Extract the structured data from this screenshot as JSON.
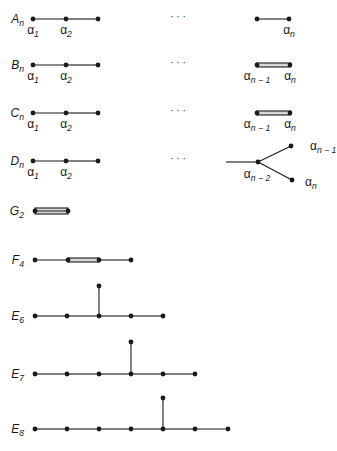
{
  "figure": {
    "ink_color": "#1a1a1a",
    "bond_fill": "#d8d8d8",
    "ellipsis": "· · ·",
    "diagrams": [
      {
        "id": "A_n",
        "label": "A",
        "sub": "n",
        "label_pos": [
          24,
          19
        ],
        "nodes": [
          [
            33,
            19
          ],
          [
            66,
            19
          ],
          [
            98,
            19
          ],
          [
            257,
            19
          ],
          [
            289,
            19
          ]
        ],
        "bonds": [
          {
            "from": 0,
            "to": 1,
            "type": "single"
          },
          {
            "from": 1,
            "to": 2,
            "type": "single"
          },
          {
            "from": 3,
            "to": 4,
            "type": "single"
          }
        ],
        "ellipsis_pos": [
          178,
          20
        ],
        "node_labels": [
          {
            "text": "α",
            "sub": "1",
            "x": 33,
            "y": 34
          },
          {
            "text": "α",
            "sub": "2",
            "x": 66,
            "y": 34
          },
          {
            "text": "α",
            "sub": "n",
            "x": 289,
            "y": 34
          }
        ]
      },
      {
        "id": "B_n",
        "label": "B",
        "sub": "n",
        "label_pos": [
          24,
          65
        ],
        "nodes": [
          [
            33,
            65
          ],
          [
            66,
            65
          ],
          [
            98,
            65
          ],
          [
            257,
            65
          ],
          [
            290,
            65
          ]
        ],
        "bonds": [
          {
            "from": 0,
            "to": 1,
            "type": "single"
          },
          {
            "from": 1,
            "to": 2,
            "type": "single"
          },
          {
            "from": 3,
            "to": 4,
            "type": "double"
          }
        ],
        "ellipsis_pos": [
          178,
          66
        ],
        "node_labels": [
          {
            "text": "α",
            "sub": "1",
            "x": 33,
            "y": 80
          },
          {
            "text": "α",
            "sub": "2",
            "x": 66,
            "y": 80
          },
          {
            "text": "α",
            "sub": "n − 1",
            "x": 257,
            "y": 80
          },
          {
            "text": "α",
            "sub": "n",
            "x": 290,
            "y": 80
          }
        ]
      },
      {
        "id": "C_n",
        "label": "C",
        "sub": "n",
        "label_pos": [
          24,
          113
        ],
        "nodes": [
          [
            33,
            113
          ],
          [
            66,
            113
          ],
          [
            98,
            113
          ],
          [
            257,
            113
          ],
          [
            290,
            113
          ]
        ],
        "bonds": [
          {
            "from": 0,
            "to": 1,
            "type": "single"
          },
          {
            "from": 1,
            "to": 2,
            "type": "single"
          },
          {
            "from": 3,
            "to": 4,
            "type": "double"
          }
        ],
        "ellipsis_pos": [
          178,
          114
        ],
        "node_labels": [
          {
            "text": "α",
            "sub": "1",
            "x": 33,
            "y": 128
          },
          {
            "text": "α",
            "sub": "2",
            "x": 66,
            "y": 128
          },
          {
            "text": "α",
            "sub": "n − 1",
            "x": 257,
            "y": 128
          },
          {
            "text": "α",
            "sub": "n",
            "x": 290,
            "y": 128
          }
        ]
      },
      {
        "id": "D_n",
        "label": "D",
        "sub": "n",
        "label_pos": [
          24,
          161
        ],
        "nodes": [
          [
            33,
            161
          ],
          [
            66,
            161
          ],
          [
            98,
            161
          ],
          [
            258,
            162
          ],
          [
            291,
            146
          ],
          [
            292,
            180
          ]
        ],
        "bonds": [
          {
            "from": 0,
            "to": 1,
            "type": "single"
          },
          {
            "from": 1,
            "to": 2,
            "type": "single"
          },
          {
            "from": 3,
            "to": 4,
            "type": "single"
          },
          {
            "from": 3,
            "to": 5,
            "type": "single"
          }
        ],
        "stub": {
          "x1": 226,
          "y1": 162,
          "x2": 258,
          "y2": 162
        },
        "ellipsis_pos": [
          178,
          162
        ],
        "node_labels": [
          {
            "text": "α",
            "sub": "1",
            "x": 33,
            "y": 176
          },
          {
            "text": "α",
            "sub": "2",
            "x": 66,
            "y": 176
          },
          {
            "text": "α",
            "sub": "n − 2",
            "x": 257,
            "y": 178
          },
          {
            "text": "α",
            "sub": "n − 1",
            "x": 310,
            "y": 150,
            "anchor": "start"
          },
          {
            "text": "α",
            "sub": "n",
            "x": 305,
            "y": 186,
            "anchor": "start"
          }
        ]
      },
      {
        "id": "G_2",
        "label": "G",
        "sub": "2",
        "label_pos": [
          24,
          211
        ],
        "nodes": [
          [
            35,
            211
          ],
          [
            68,
            211
          ]
        ],
        "bonds": [
          {
            "from": 0,
            "to": 1,
            "type": "triple"
          }
        ],
        "node_labels": []
      },
      {
        "id": "F_4",
        "label": "F",
        "sub": "4",
        "label_pos": [
          24,
          260
        ],
        "nodes": [
          [
            35,
            260
          ],
          [
            68,
            260
          ],
          [
            99,
            260
          ],
          [
            131,
            260
          ]
        ],
        "bonds": [
          {
            "from": 0,
            "to": 1,
            "type": "single"
          },
          {
            "from": 1,
            "to": 2,
            "type": "double"
          },
          {
            "from": 2,
            "to": 3,
            "type": "single"
          }
        ],
        "node_labels": []
      },
      {
        "id": "E_6",
        "label": "E",
        "sub": "6",
        "label_pos": [
          24,
          316
        ],
        "nodes": [
          [
            35,
            316
          ],
          [
            67,
            316
          ],
          [
            99,
            316
          ],
          [
            131,
            316
          ],
          [
            163,
            316
          ],
          [
            99,
            286
          ]
        ],
        "bonds": [
          {
            "from": 0,
            "to": 1,
            "type": "single"
          },
          {
            "from": 1,
            "to": 2,
            "type": "single"
          },
          {
            "from": 2,
            "to": 3,
            "type": "single"
          },
          {
            "from": 3,
            "to": 4,
            "type": "single"
          },
          {
            "from": 2,
            "to": 5,
            "type": "single"
          }
        ],
        "node_labels": []
      },
      {
        "id": "E_7",
        "label": "E",
        "sub": "7",
        "label_pos": [
          24,
          374
        ],
        "nodes": [
          [
            35,
            374
          ],
          [
            67,
            374
          ],
          [
            99,
            374
          ],
          [
            131,
            374
          ],
          [
            163,
            374
          ],
          [
            195,
            374
          ],
          [
            131,
            342
          ]
        ],
        "bonds": [
          {
            "from": 0,
            "to": 1,
            "type": "single"
          },
          {
            "from": 1,
            "to": 2,
            "type": "single"
          },
          {
            "from": 2,
            "to": 3,
            "type": "single"
          },
          {
            "from": 3,
            "to": 4,
            "type": "single"
          },
          {
            "from": 4,
            "to": 5,
            "type": "single"
          },
          {
            "from": 3,
            "to": 6,
            "type": "single"
          }
        ],
        "node_labels": []
      },
      {
        "id": "E_8",
        "label": "E",
        "sub": "8",
        "label_pos": [
          24,
          429
        ],
        "nodes": [
          [
            35,
            429
          ],
          [
            67,
            429
          ],
          [
            99,
            429
          ],
          [
            131,
            429
          ],
          [
            163,
            429
          ],
          [
            195,
            429
          ],
          [
            228,
            429
          ],
          [
            163,
            398
          ]
        ],
        "bonds": [
          {
            "from": 0,
            "to": 1,
            "type": "single"
          },
          {
            "from": 1,
            "to": 2,
            "type": "single"
          },
          {
            "from": 2,
            "to": 3,
            "type": "single"
          },
          {
            "from": 3,
            "to": 4,
            "type": "single"
          },
          {
            "from": 4,
            "to": 5,
            "type": "single"
          },
          {
            "from": 5,
            "to": 6,
            "type": "single"
          },
          {
            "from": 4,
            "to": 7,
            "type": "single"
          }
        ],
        "node_labels": []
      }
    ]
  }
}
